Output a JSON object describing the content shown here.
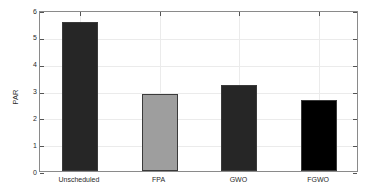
{
  "chart_data": {
    "type": "bar",
    "title": "",
    "xlabel": "",
    "ylabel": "PAR",
    "categories": [
      "Unscheduled",
      "FPA",
      "GWO",
      "FGWO"
    ],
    "values": [
      5.55,
      2.88,
      3.22,
      2.65
    ],
    "bar_colors": [
      "#262626",
      "#9e9e9e",
      "#262626",
      "#000000"
    ],
    "bar_edge_color": "#3a3a3a",
    "ylim": [
      0,
      6
    ],
    "yticks": [
      0,
      1,
      2,
      3,
      4,
      5,
      6
    ],
    "ytick_labels": [
      "0",
      "1",
      "2",
      "3",
      "4",
      "5",
      "6"
    ],
    "xtick_labels": [
      "Unscheduled",
      "FPA",
      "GWO",
      "FGWO"
    ],
    "grid": true,
    "grid_color": "#ebebeb",
    "axis_color": "#8a8a8a",
    "legend": null,
    "legend_position": "none",
    "background": "#ffffff"
  },
  "figure": {
    "width": 377,
    "height": 194
  }
}
